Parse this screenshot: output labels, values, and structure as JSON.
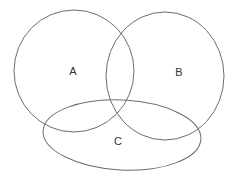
{
  "diagram": {
    "type": "venn",
    "sets": [
      {
        "label": "A",
        "shape": "circle",
        "cx": 74,
        "cy": 71,
        "rx": 60,
        "ry": 61
      },
      {
        "label": "B",
        "shape": "circle",
        "cx": 165,
        "cy": 76,
        "rx": 59,
        "ry": 64
      },
      {
        "label": "C",
        "shape": "ellipse",
        "cx": 122,
        "cy": 135,
        "rx": 79,
        "ry": 35
      }
    ],
    "label_positions": {
      "A": {
        "x": 73,
        "y": 71
      },
      "B": {
        "x": 179,
        "y": 72
      },
      "C": {
        "x": 118,
        "y": 141
      }
    },
    "stroke_color": "#6e6e6e",
    "background": "#ffffff"
  }
}
